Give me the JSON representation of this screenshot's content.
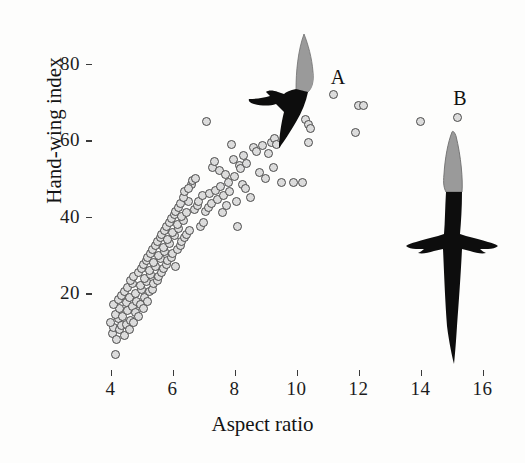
{
  "chart_data": {
    "type": "scatter",
    "title": "",
    "xlabel": "Aspect ratio",
    "ylabel": "Hand-wing index",
    "xlim": [
      3.4,
      16.5
    ],
    "ylim": [
      0,
      88
    ],
    "xticks": [
      4,
      6,
      8,
      10,
      12,
      14,
      16
    ],
    "yticks": [
      20,
      40,
      60,
      80
    ],
    "grid": false,
    "legend": null,
    "marker": {
      "shape": "circle",
      "fill": "#dcdcdc",
      "edge": "#4a4a4a",
      "size_px": 9
    },
    "annotations": [
      {
        "label": "A",
        "x": 11.2,
        "y": 76.5,
        "note": "swift silhouette, high aspect ratio and high hand-wing index"
      },
      {
        "label": "B",
        "x": 15.2,
        "y": 70.5,
        "note": "albatross silhouette, highest aspect ratio"
      }
    ],
    "series": [
      {
        "name": "species",
        "points": [
          [
            4.15,
            4.0
          ],
          [
            4.05,
            9.5
          ],
          [
            4.1,
            11.0
          ],
          [
            4.2,
            8.0
          ],
          [
            4.3,
            10.5
          ],
          [
            4.0,
            12.5
          ],
          [
            4.25,
            13.5
          ],
          [
            4.35,
            11.5
          ],
          [
            4.15,
            14.5
          ],
          [
            4.45,
            9.0
          ],
          [
            4.3,
            16.0
          ],
          [
            4.1,
            17.0
          ],
          [
            4.5,
            12.0
          ],
          [
            4.4,
            14.0
          ],
          [
            4.55,
            15.5
          ],
          [
            4.25,
            18.5
          ],
          [
            4.6,
            10.5
          ],
          [
            4.35,
            19.5
          ],
          [
            4.65,
            13.0
          ],
          [
            4.5,
            17.5
          ],
          [
            4.7,
            16.5
          ],
          [
            4.45,
            20.5
          ],
          [
            4.75,
            12.5
          ],
          [
            4.6,
            19.0
          ],
          [
            4.8,
            15.0
          ],
          [
            4.55,
            21.5
          ],
          [
            4.85,
            18.0
          ],
          [
            4.7,
            22.5
          ],
          [
            4.9,
            14.0
          ],
          [
            4.65,
            23.5
          ],
          [
            4.95,
            17.0
          ],
          [
            4.8,
            20.0
          ],
          [
            5.0,
            21.0
          ],
          [
            4.75,
            24.5
          ],
          [
            5.05,
            16.0
          ],
          [
            4.9,
            25.5
          ],
          [
            5.1,
            19.0
          ],
          [
            4.95,
            22.0
          ],
          [
            5.15,
            23.0
          ],
          [
            5.0,
            26.5
          ],
          [
            5.2,
            18.0
          ],
          [
            5.05,
            27.5
          ],
          [
            5.25,
            20.5
          ],
          [
            5.1,
            24.0
          ],
          [
            5.3,
            25.0
          ],
          [
            5.15,
            28.5
          ],
          [
            5.35,
            21.0
          ],
          [
            5.2,
            29.5
          ],
          [
            5.4,
            22.5
          ],
          [
            5.25,
            26.0
          ],
          [
            5.45,
            27.0
          ],
          [
            5.3,
            30.5
          ],
          [
            5.5,
            23.5
          ],
          [
            5.35,
            31.5
          ],
          [
            5.55,
            24.5
          ],
          [
            5.4,
            28.0
          ],
          [
            5.6,
            29.0
          ],
          [
            5.45,
            32.5
          ],
          [
            5.65,
            25.5
          ],
          [
            5.5,
            33.5
          ],
          [
            5.7,
            26.5
          ],
          [
            5.55,
            30.0
          ],
          [
            5.75,
            31.0
          ],
          [
            5.6,
            34.5
          ],
          [
            5.8,
            27.5
          ],
          [
            5.65,
            35.5
          ],
          [
            5.85,
            28.5
          ],
          [
            5.7,
            32.0
          ],
          [
            5.9,
            33.0
          ],
          [
            5.75,
            36.5
          ],
          [
            5.95,
            29.5
          ],
          [
            5.8,
            37.5
          ],
          [
            6.0,
            30.5
          ],
          [
            5.85,
            34.0
          ],
          [
            6.05,
            35.0
          ],
          [
            5.9,
            38.5
          ],
          [
            6.1,
            27.0
          ],
          [
            5.95,
            39.5
          ],
          [
            6.15,
            31.5
          ],
          [
            6.0,
            36.0
          ],
          [
            6.2,
            37.0
          ],
          [
            6.05,
            40.5
          ],
          [
            6.25,
            32.5
          ],
          [
            6.1,
            41.5
          ],
          [
            6.3,
            33.5
          ],
          [
            6.15,
            38.0
          ],
          [
            6.35,
            39.0
          ],
          [
            6.2,
            42.5
          ],
          [
            6.4,
            34.5
          ],
          [
            6.25,
            43.5
          ],
          [
            6.45,
            35.5
          ],
          [
            6.3,
            40.0
          ],
          [
            6.5,
            44.0
          ],
          [
            6.35,
            45.0
          ],
          [
            6.55,
            36.5
          ],
          [
            6.4,
            46.5
          ],
          [
            6.6,
            48.5
          ],
          [
            6.45,
            41.0
          ],
          [
            6.65,
            49.5
          ],
          [
            6.5,
            47.5
          ],
          [
            6.7,
            42.0
          ],
          [
            6.75,
            50.0
          ],
          [
            6.8,
            43.0
          ],
          [
            6.85,
            44.0
          ],
          [
            6.9,
            37.5
          ],
          [
            6.95,
            45.5
          ],
          [
            7.0,
            38.5
          ],
          [
            7.05,
            41.5
          ],
          [
            7.1,
            65.0
          ],
          [
            7.15,
            42.5
          ],
          [
            7.2,
            46.0
          ],
          [
            7.25,
            43.5
          ],
          [
            7.3,
            53.0
          ],
          [
            7.35,
            54.5
          ],
          [
            7.4,
            47.0
          ],
          [
            7.45,
            44.5
          ],
          [
            7.5,
            52.0
          ],
          [
            7.55,
            48.0
          ],
          [
            7.6,
            41.0
          ],
          [
            7.65,
            45.5
          ],
          [
            7.7,
            51.0
          ],
          [
            7.75,
            43.0
          ],
          [
            7.8,
            49.0
          ],
          [
            7.85,
            46.5
          ],
          [
            7.9,
            59.0
          ],
          [
            7.95,
            55.0
          ],
          [
            8.0,
            50.5
          ],
          [
            8.05,
            44.0
          ],
          [
            8.1,
            37.5
          ],
          [
            8.15,
            53.5
          ],
          [
            8.2,
            52.5
          ],
          [
            8.25,
            48.5
          ],
          [
            8.3,
            56.0
          ],
          [
            8.35,
            47.5
          ],
          [
            8.4,
            54.0
          ],
          [
            8.5,
            45.0
          ],
          [
            8.6,
            58.0
          ],
          [
            8.7,
            57.0
          ],
          [
            8.8,
            51.5
          ],
          [
            8.9,
            58.5
          ],
          [
            9.0,
            50.0
          ],
          [
            9.1,
            56.5
          ],
          [
            9.2,
            59.5
          ],
          [
            9.25,
            53.0
          ],
          [
            9.3,
            60.5
          ],
          [
            9.35,
            59.0
          ],
          [
            9.5,
            49.0
          ],
          [
            9.9,
            49.0
          ],
          [
            10.2,
            49.0
          ],
          [
            10.3,
            65.5
          ],
          [
            10.4,
            64.0
          ],
          [
            10.45,
            63.0
          ],
          [
            10.4,
            59.5
          ],
          [
            11.2,
            72.0
          ],
          [
            11.9,
            62.0
          ],
          [
            12.0,
            69.0
          ],
          [
            12.15,
            69.0
          ],
          [
            14.0,
            65.0
          ],
          [
            15.2,
            66.0
          ]
        ]
      }
    ]
  },
  "figure": {
    "axis_color": "#3a3a3a",
    "background": "#fdfdfc",
    "bird_a": {
      "name": "swift-silhouette",
      "wing_tip_color": "#9a9a9a",
      "body_color": "#0d0d0d"
    },
    "bird_b": {
      "name": "albatross-silhouette",
      "wing_tip_color": "#9a9a9a",
      "body_color": "#0d0d0d"
    }
  }
}
